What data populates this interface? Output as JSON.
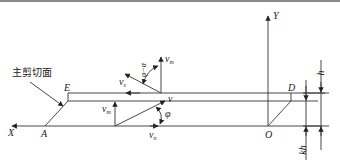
{
  "diagram": {
    "title": "",
    "annotation": "主剪切面",
    "axes": {
      "x": "X",
      "y": "Y"
    },
    "points": {
      "A": "A",
      "E": "E",
      "D": "D",
      "O": "O"
    },
    "velocities": {
      "v": {
        "base": "v",
        "sub": ""
      },
      "v_m": {
        "base": "v",
        "sub": "m"
      },
      "v_s": {
        "base": "v",
        "sub": "s"
      },
      "v_mz": {
        "base": "v",
        "sub": "m"
      },
      "v_n": {
        "base": "v",
        "sub": "n"
      }
    },
    "angles": {
      "phi": "φ",
      "phi_minus_alpha": "φ−α"
    },
    "dimensions": {
      "h": "h",
      "kh": "kh"
    },
    "colors": {
      "line": "#333333",
      "border": "#8a8a8a"
    }
  }
}
